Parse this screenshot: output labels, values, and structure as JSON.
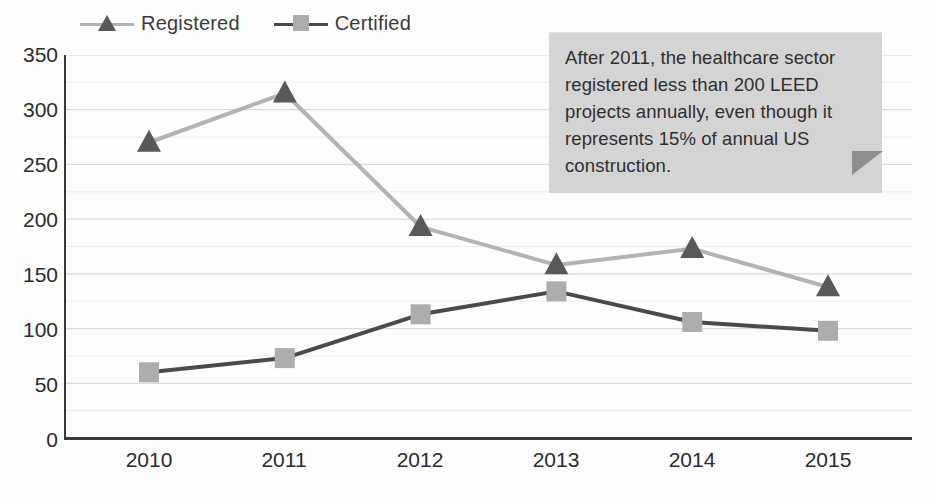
{
  "chart_data": {
    "type": "line",
    "title": "",
    "subtitle": "",
    "xlabel": "",
    "ylabel": "",
    "categories": [
      "2010",
      "2011",
      "2012",
      "2013",
      "2014",
      "2015"
    ],
    "x": [
      2010,
      2011,
      2012,
      2013,
      2014,
      2015
    ],
    "series": [
      {
        "name": "Registered",
        "marker": "triangle",
        "line_color": "#b3b3b3",
        "marker_color": "#595959",
        "values": [
          270,
          315,
          193,
          158,
          173,
          138
        ]
      },
      {
        "name": "Certified",
        "marker": "square",
        "line_color": "#4a4a4a",
        "marker_color": "#adadad",
        "values": [
          60,
          73,
          113,
          134,
          106,
          98
        ]
      }
    ],
    "ylim": [
      0,
      350
    ],
    "ytick_values": [
      0,
      50,
      100,
      150,
      200,
      250,
      300,
      350
    ],
    "ytick_labels": [
      "0",
      "50",
      "100",
      "150",
      "200",
      "250",
      "300",
      "350"
    ],
    "ytick_minor_step": 25,
    "grid": true,
    "grid_orientation": "horizontal",
    "legend_position": "top-left",
    "annotations": [
      {
        "name": "callout",
        "text": "After 2011, the healthcare sector registered less than 200 LEED projects annually, even though it represents 15% of annual US construction.",
        "background_color": "#d4d4d4",
        "tail_color": "#8e8e8e",
        "position": "top-right"
      }
    ]
  },
  "legend": {
    "entries": [
      {
        "label": "Registered"
      },
      {
        "label": "Certified"
      }
    ]
  },
  "axes": {
    "y_labels": [
      "350",
      "300",
      "250",
      "200",
      "150",
      "100",
      "50",
      "0"
    ],
    "x_labels": [
      "2010",
      "2011",
      "2012",
      "2013",
      "2014",
      "2015"
    ]
  },
  "callout": {
    "text": "After 2011, the healthcare sector registered less than 200 LEED projects annually, even though it represents 15% of annual US construction."
  },
  "colors": {
    "registered_line": "#b3b3b3",
    "registered_marker": "#595959",
    "certified_line": "#4a4a4a",
    "certified_marker": "#adadad",
    "grid": "#d9d9d9",
    "axis": "#3a3a3a",
    "callout_bg": "#d4d4d4",
    "callout_tail": "#8e8e8e",
    "text": "#2b2b2b"
  }
}
